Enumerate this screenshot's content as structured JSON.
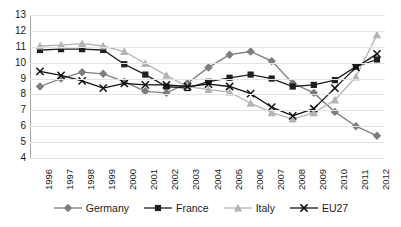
{
  "chart_data": {
    "type": "line",
    "title": "",
    "subtitle": "",
    "xlabel": "",
    "ylabel": "",
    "grid": true,
    "legend_position": "bottom",
    "x": [
      1996,
      1997,
      1998,
      1999,
      2000,
      2001,
      2002,
      2003,
      2004,
      2005,
      2006,
      2007,
      2008,
      2009,
      2010,
      2011,
      2012
    ],
    "categories": [
      "1996",
      "1997",
      "1998",
      "1999",
      "2000",
      "2001",
      "2002",
      "2003",
      "2004",
      "2005",
      "2006",
      "2007",
      "2008",
      "2009",
      "2010",
      "2011",
      "2012"
    ],
    "ylim": [
      4,
      13
    ],
    "yticks": [
      4,
      5,
      6,
      7,
      8,
      9,
      10,
      11,
      12,
      13
    ],
    "ytick_labels": [
      "4",
      "5",
      "6",
      "7",
      "8",
      "9",
      "10",
      "11",
      "12",
      "13"
    ],
    "series": [
      {
        "name": "Germany",
        "marker": "diamond",
        "color": "#7d7d7d",
        "values": [
          8.5,
          9.0,
          9.4,
          9.3,
          8.8,
          8.2,
          8.1,
          8.7,
          9.7,
          10.5,
          10.7,
          10.1,
          8.7,
          8.1,
          6.9,
          6.0,
          5.4
        ]
      },
      {
        "name": "France",
        "marker": "square",
        "color": "#1f1f1f",
        "values": [
          10.8,
          10.85,
          10.85,
          10.8,
          9.9,
          9.25,
          8.5,
          8.4,
          8.8,
          9.05,
          9.25,
          9.0,
          8.5,
          8.6,
          8.9,
          9.75,
          10.2
        ]
      },
      {
        "name": "Italy",
        "marker": "triangle",
        "color": "#b3b3b3",
        "values": [
          11.05,
          11.1,
          11.2,
          11.05,
          10.7,
          9.95,
          9.2,
          8.5,
          8.3,
          8.15,
          7.45,
          6.85,
          6.45,
          6.85,
          7.65,
          9.1,
          11.75
        ]
      },
      {
        "name": "EU27",
        "marker": "cross",
        "color": "#111111",
        "values": [
          9.45,
          9.2,
          8.85,
          8.4,
          8.7,
          8.6,
          8.6,
          8.5,
          8.65,
          8.5,
          8.05,
          7.2,
          6.65,
          7.1,
          8.4,
          9.7,
          10.55
        ]
      }
    ]
  },
  "legend": {
    "items": [
      {
        "label": "Germany",
        "marker": "diamond",
        "color": "#7d7d7d"
      },
      {
        "label": "France",
        "marker": "square",
        "color": "#1f1f1f"
      },
      {
        "label": "Italy",
        "marker": "triangle",
        "color": "#b3b3b3"
      },
      {
        "label": "EU27",
        "marker": "cross",
        "color": "#111111"
      }
    ]
  },
  "axes": {
    "y_min_label": "4",
    "y_max_label": "13"
  },
  "colors": {
    "grid": "#e3e3e3",
    "axis": "#a6a6a6",
    "text": "#1a1a1a",
    "background": "#ffffff"
  }
}
